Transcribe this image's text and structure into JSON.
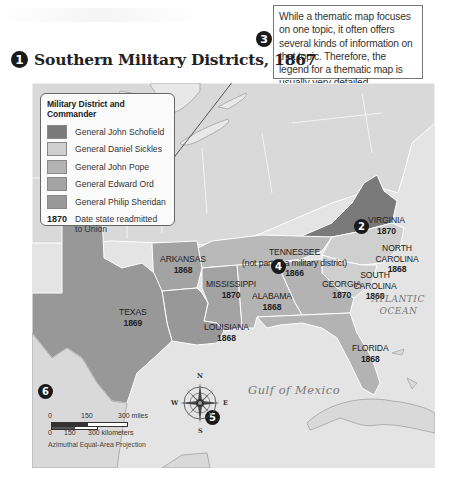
{
  "callout": {
    "text": "While a thematic map focuses on one topic, it often offers several kinds of information on that topic. Therefore, the legend for a thematic map is usually very detailed."
  },
  "header": {
    "badge": "1",
    "title": "Southern Military Districts, 1867"
  },
  "legend": {
    "title": "Military District and Commander",
    "items": [
      {
        "label": "General John Schofield",
        "color": "#7a7a7a"
      },
      {
        "label": "General Daniel Sickles",
        "color": "#cfcfcf"
      },
      {
        "label": "General John Pope",
        "color": "#b3b3b3"
      },
      {
        "label": "General Edward Ord",
        "color": "#a3a3a3"
      },
      {
        "label": "General Philip Sheridan",
        "color": "#989898"
      }
    ],
    "date_key": "1870",
    "date_text": "Date state readmitted to Union"
  },
  "states": [
    {
      "name": "VIRGINIA",
      "year": "1870"
    },
    {
      "name": "NORTH CAROLINA",
      "year": "1868"
    },
    {
      "name": "SOUTH CAROLINA",
      "year": "1868"
    },
    {
      "name": "TENNESSEE",
      "note": "(not part of a military district)",
      "year": "1866"
    },
    {
      "name": "ARKANSAS",
      "year": "1868"
    },
    {
      "name": "MISSISSIPPI",
      "year": "1870"
    },
    {
      "name": "ALABAMA",
      "year": "1868"
    },
    {
      "name": "GEORGIA",
      "year": "1870"
    },
    {
      "name": "TEXAS",
      "year": "1869"
    },
    {
      "name": "LOUISIANA",
      "year": "1868"
    },
    {
      "name": "FLORIDA",
      "year": "1868"
    }
  ],
  "water": {
    "atlantic_line1": "ATLANTIC",
    "atlantic_line2": "OCEAN",
    "gulf": "Gulf of Mexico"
  },
  "badges": {
    "b2": "2",
    "b3": "3",
    "b4": "4",
    "b5": "5",
    "b6": "6"
  },
  "compass": {
    "n": "N",
    "s": "S",
    "e": "E",
    "w": "W"
  },
  "scale": {
    "miles_ticks": [
      "0",
      "150",
      "300 miles"
    ],
    "km_ticks": [
      "0",
      "150",
      "300 kilometers"
    ],
    "projection": "Azimuthal Equal-Area Projection"
  },
  "colors": {
    "water": "#e6e6e6",
    "land_other": "#d9d9d9",
    "schofield": "#7a7a7a",
    "sickles": "#cfcfcf",
    "pope": "#b3b3b3",
    "ord": "#a3a3a3",
    "sheridan": "#989898",
    "tennessee": "#b9b9b9"
  }
}
